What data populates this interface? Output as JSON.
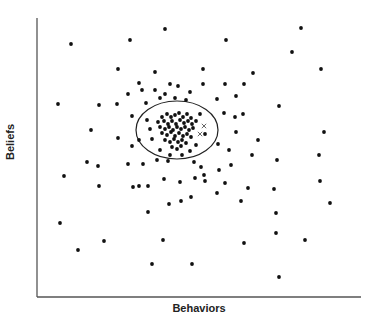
{
  "chart_data": {
    "type": "scatter",
    "title": "",
    "xlabel": "Behaviors",
    "ylabel": "Beliefs",
    "grid": false,
    "legend": null,
    "axis_ticks": false,
    "coordinate_note": "Points given in pixel coordinates of the 378x323 figure (x right, y down); axes have no numeric ticks.",
    "axes": {
      "x0": 37,
      "y0": 297,
      "x1": 361,
      "y1": 18
    },
    "ellipse": {
      "cx": 177,
      "cy": 130,
      "rx": 41,
      "ry": 29
    },
    "series": [
      {
        "name": "points",
        "marker": "dot",
        "points": [
          [
            71,
            44
          ],
          [
            130,
            40
          ],
          [
            165,
            29
          ],
          [
            226,
            40
          ],
          [
            301,
            28
          ],
          [
            292,
            52
          ],
          [
            118,
            69
          ],
          [
            155,
            72
          ],
          [
            203,
            69
          ],
          [
            253,
            73
          ],
          [
            321,
            69
          ],
          [
            139,
            83
          ],
          [
            170,
            84
          ],
          [
            203,
            84
          ],
          [
            225,
            84
          ],
          [
            244,
            84
          ],
          [
            99,
            105
          ],
          [
            117,
            104
          ],
          [
            58,
            104
          ],
          [
            128,
            94
          ],
          [
            142,
            90
          ],
          [
            155,
            90
          ],
          [
            165,
            94
          ],
          [
            178,
            86
          ],
          [
            190,
            92
          ],
          [
            146,
            103
          ],
          [
            160,
            98
          ],
          [
            175,
            98
          ],
          [
            186,
            100
          ],
          [
            217,
            99
          ],
          [
            236,
            96
          ],
          [
            279,
            106
          ],
          [
            91,
            130
          ],
          [
            132,
            116
          ],
          [
            118,
            138
          ],
          [
            132,
            146
          ],
          [
            139,
            140
          ],
          [
            224,
            113
          ],
          [
            235,
            117
          ],
          [
            243,
            114
          ],
          [
            236,
            132
          ],
          [
            218,
            144
          ],
          [
            229,
            150
          ],
          [
            324,
            132
          ],
          [
            258,
            140
          ],
          [
            252,
            155
          ],
          [
            128,
            164
          ],
          [
            98,
            166
          ],
          [
            143,
            164
          ],
          [
            157,
            160
          ],
          [
            168,
            161
          ],
          [
            194,
            162
          ],
          [
            201,
            167
          ],
          [
            219,
            170
          ],
          [
            231,
            165
          ],
          [
            277,
            160
          ],
          [
            319,
            155
          ],
          [
            64,
            176
          ],
          [
            87,
            162
          ],
          [
            133,
            187
          ],
          [
            148,
            186
          ],
          [
            164,
            179
          ],
          [
            180,
            182
          ],
          [
            195,
            178
          ],
          [
            204,
            175
          ],
          [
            217,
            193
          ],
          [
            225,
            183
          ],
          [
            248,
            188
          ],
          [
            99,
            186
          ],
          [
            139,
            186
          ],
          [
            148,
            212
          ],
          [
            169,
            204
          ],
          [
            181,
            201
          ],
          [
            191,
            197
          ],
          [
            205,
            181
          ],
          [
            241,
            201
          ],
          [
            274,
            189
          ],
          [
            276,
            213
          ],
          [
            320,
            181
          ],
          [
            330,
            203
          ],
          [
            60,
            223
          ],
          [
            104,
            241
          ],
          [
            163,
            240
          ],
          [
            244,
            243
          ],
          [
            276,
            233
          ],
          [
            305,
            240
          ],
          [
            78,
            250
          ],
          [
            152,
            264
          ],
          [
            192,
            264
          ],
          [
            279,
            277
          ]
        ]
      },
      {
        "name": "cluster",
        "marker": "dot",
        "points": [
          [
            162,
            117
          ],
          [
            167,
            114
          ],
          [
            171,
            117
          ],
          [
            175,
            115
          ],
          [
            179,
            113
          ],
          [
            183,
            117
          ],
          [
            187,
            114
          ],
          [
            191,
            118
          ],
          [
            158,
            122
          ],
          [
            164,
            121
          ],
          [
            168,
            124
          ],
          [
            172,
            121
          ],
          [
            176,
            124
          ],
          [
            180,
            120
          ],
          [
            184,
            123
          ],
          [
            188,
            121
          ],
          [
            192,
            124
          ],
          [
            196,
            121
          ],
          [
            160,
            127
          ],
          [
            165,
            129
          ],
          [
            169,
            127
          ],
          [
            173,
            130
          ],
          [
            177,
            127
          ],
          [
            181,
            129
          ],
          [
            185,
            127
          ],
          [
            189,
            130
          ],
          [
            193,
            128
          ],
          [
            162,
            133
          ],
          [
            167,
            135
          ],
          [
            171,
            132
          ],
          [
            175,
            136
          ],
          [
            179,
            133
          ],
          [
            183,
            136
          ],
          [
            187,
            134
          ],
          [
            191,
            137
          ],
          [
            165,
            140
          ],
          [
            170,
            142
          ],
          [
            174,
            139
          ],
          [
            178,
            142
          ],
          [
            182,
            140
          ],
          [
            186,
            143
          ],
          [
            172,
            147
          ],
          [
            177,
            149
          ],
          [
            181,
            146
          ],
          [
            150,
            129
          ],
          [
            152,
            139
          ],
          [
            147,
            120
          ],
          [
            200,
            114
          ],
          [
            205,
            134
          ],
          [
            196,
            145
          ],
          [
            160,
            150
          ],
          [
            190,
            151
          ],
          [
            170,
            155
          ],
          [
            182,
            155
          ]
        ]
      },
      {
        "name": "crosses",
        "marker": "x",
        "points": [
          [
            204,
            126
          ],
          [
            200,
            134
          ]
        ]
      }
    ]
  }
}
